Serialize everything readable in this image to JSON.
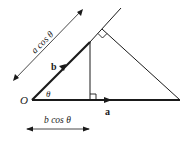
{
  "diagram": {
    "type": "vector-projection",
    "labels": {
      "origin": "O",
      "vector_b": "b",
      "vector_a": "a",
      "angle": "θ",
      "projection_a_on_b": "a cos θ",
      "projection_b_on_a": "b cos θ"
    },
    "points": {
      "O": [
        32,
        100
      ],
      "a_end": [
        180,
        100
      ],
      "b_end": [
        90,
        42
      ],
      "foot_on_a": [
        90,
        100
      ],
      "foot_on_b": [
        102,
        30
      ],
      "b_line_extension_end": [
        121,
        8
      ]
    },
    "colors": {
      "stroke": "#1a1a1a",
      "background": "#ffffff"
    }
  }
}
